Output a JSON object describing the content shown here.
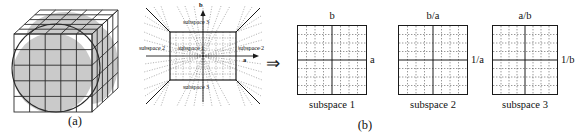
{
  "figure": {
    "part_a": {
      "caption": "(a)",
      "description": "3D cube partitioned into a grid of cells with an inscribed shaded sphere"
    },
    "part_b": {
      "caption": "(b)"
    },
    "middle_diagram": {
      "axis_vertical_label": "b",
      "axis_horizontal_label": "a",
      "regions": {
        "center": "subspace 1",
        "left": "subspace 2",
        "right": "subspace 2",
        "top": "subspace 3",
        "bottom": "subspace 3"
      }
    },
    "transform_arrow": "⇒",
    "panels": [
      {
        "top_label": "b",
        "side_label": "a",
        "caption": "subspace 1"
      },
      {
        "top_label": "b/a",
        "side_label": "1/a",
        "caption": "subspace 2"
      },
      {
        "top_label": "a/b",
        "side_label": "1/b",
        "caption": "subspace 3"
      }
    ],
    "colors": {
      "line": "#1a1a1a",
      "fill_shaded": "#c9c9c9",
      "background": "#ffffff",
      "dashed_grid": "#333333"
    }
  }
}
